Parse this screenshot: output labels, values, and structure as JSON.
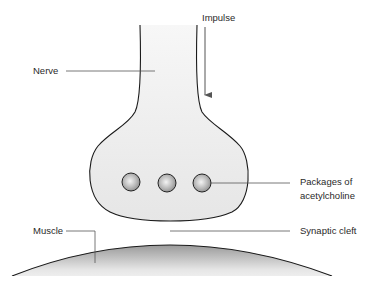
{
  "diagram": {
    "labels": {
      "impulse": "Impulse",
      "nerve": "Nerve",
      "packages_line1": "Packages of",
      "packages_line2": "acetylcholine",
      "muscle": "Muscle",
      "synaptic_cleft": "Synaptic cleft"
    },
    "vesicles": [
      {
        "cx": 131,
        "cy": 182,
        "r": 9
      },
      {
        "cx": 167,
        "cy": 183,
        "r": 9
      },
      {
        "cx": 202,
        "cy": 183,
        "r": 9
      }
    ],
    "colors": {
      "outline": "#1a1a1a",
      "fill_light": "#ececec",
      "leader_line": "#555555",
      "text": "#2a2a2a"
    }
  }
}
